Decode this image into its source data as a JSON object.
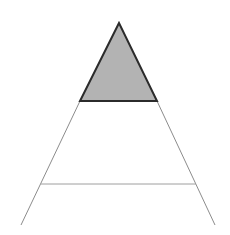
{
  "diagram": {
    "type": "pyramid",
    "width": 230,
    "height": 235,
    "background": "#ffffff",
    "top_section": {
      "label": "",
      "fill": "#b3b3b3",
      "stroke": "#2b2b2b",
      "stroke_width": 2,
      "points": [
        [
          119,
          23
        ],
        [
          80,
          101
        ],
        [
          157,
          101
        ]
      ]
    },
    "outer_lines": {
      "stroke": "#8c8c8c",
      "stroke_width": 1,
      "left": [
        [
          80,
          101
        ],
        [
          21,
          225
        ]
      ],
      "right": [
        [
          157,
          101
        ],
        [
          215,
          225
        ]
      ]
    },
    "divider": {
      "stroke": "#9e9e9e",
      "stroke_width": 1,
      "y": 184,
      "x1": 41,
      "x2": 196
    },
    "sections": [
      {
        "name": "top",
        "shaded": true
      },
      {
        "name": "middle",
        "shaded": false
      },
      {
        "name": "bottom",
        "shaded": false
      }
    ]
  }
}
